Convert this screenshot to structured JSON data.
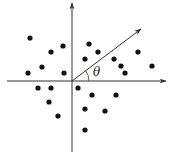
{
  "diagram": {
    "type": "scatter-with-axes",
    "origin": [
      72,
      81
    ],
    "x_axis": {
      "from": [
        7,
        81
      ],
      "to": [
        166,
        81
      ]
    },
    "y_axis": {
      "from": [
        72,
        152
      ],
      "to": [
        72,
        3
      ]
    },
    "direction_vector": {
      "from": [
        72,
        81
      ],
      "to": [
        141,
        29
      ]
    },
    "angle_label": "θ",
    "angle_label_pos": [
      93,
      76
    ],
    "colors": {
      "stroke": "#333333",
      "points": "#111111",
      "background": "#ffffff"
    },
    "points": [
      [
        30,
        38
      ],
      [
        63,
        46
      ],
      [
        51,
        52
      ],
      [
        89,
        44
      ],
      [
        98,
        52
      ],
      [
        85,
        59
      ],
      [
        138,
        52
      ],
      [
        114,
        59
      ],
      [
        121,
        66
      ],
      [
        125,
        73
      ],
      [
        152,
        66
      ],
      [
        42,
        67
      ],
      [
        28,
        73
      ],
      [
        64,
        73
      ],
      [
        38,
        88
      ],
      [
        51,
        88
      ],
      [
        78,
        88
      ],
      [
        49,
        102
      ],
      [
        92,
        95
      ],
      [
        116,
        95
      ],
      [
        85,
        109
      ],
      [
        105,
        111
      ],
      [
        58,
        116
      ],
      [
        85,
        130
      ]
    ]
  }
}
